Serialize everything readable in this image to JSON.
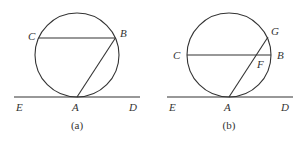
{
  "figures": [
    {
      "caption": "(a)",
      "circle": {
        "cx": 77,
        "cy": 55,
        "r": 42
      },
      "tangent_line": {
        "x1": 14,
        "y1": 97,
        "x2": 140,
        "y2": 97
      },
      "segments": [
        {
          "name": "chord-cb",
          "x1": 38.6,
          "y1": 38,
          "x2": 115.4,
          "y2": 38
        },
        {
          "name": "chord-ab",
          "x1": 77,
          "y1": 97,
          "x2": 115.4,
          "y2": 38
        }
      ],
      "labels": [
        {
          "text": "C",
          "x": 28,
          "y": 40
        },
        {
          "text": "B",
          "x": 120,
          "y": 37
        },
        {
          "text": "E",
          "x": 16,
          "y": 111
        },
        {
          "text": "A",
          "x": 72,
          "y": 111
        },
        {
          "text": "D",
          "x": 129,
          "y": 111
        }
      ],
      "caption_pos": {
        "x": 77,
        "y": 129
      }
    },
    {
      "caption": "(b)",
      "circle": {
        "cx": 229,
        "cy": 55,
        "r": 42
      },
      "tangent_line": {
        "x1": 167,
        "y1": 97,
        "x2": 293,
        "y2": 97
      },
      "segments": [
        {
          "name": "chord-cb",
          "x1": 187,
          "y1": 55,
          "x2": 271,
          "y2": 55
        },
        {
          "name": "chord-ag",
          "x1": 229,
          "y1": 97,
          "x2": 268,
          "y2": 37
        }
      ],
      "labels": [
        {
          "text": "C",
          "x": 173,
          "y": 59
        },
        {
          "text": "B",
          "x": 277,
          "y": 59
        },
        {
          "text": "G",
          "x": 271,
          "y": 35
        },
        {
          "text": "F",
          "x": 257,
          "y": 68
        },
        {
          "text": "E",
          "x": 169,
          "y": 111
        },
        {
          "text": "A",
          "x": 224,
          "y": 111
        },
        {
          "text": "D",
          "x": 281,
          "y": 111
        }
      ],
      "caption_pos": {
        "x": 229,
        "y": 129
      }
    }
  ]
}
